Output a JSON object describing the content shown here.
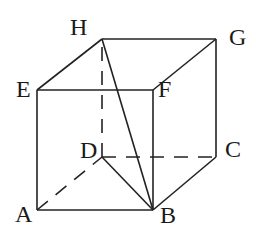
{
  "diagram": {
    "type": "cube",
    "vertices": {
      "A": {
        "label": "A",
        "x": 37,
        "y": 210
      },
      "B": {
        "label": "B",
        "x": 153,
        "y": 210
      },
      "C": {
        "label": "C",
        "x": 216,
        "y": 157
      },
      "D": {
        "label": "D",
        "x": 102,
        "y": 157
      },
      "E": {
        "label": "E",
        "x": 37,
        "y": 90
      },
      "F": {
        "label": "F",
        "x": 153,
        "y": 90
      },
      "G": {
        "label": "G",
        "x": 216,
        "y": 39
      },
      "H": {
        "label": "H",
        "x": 102,
        "y": 39
      }
    },
    "solid_edges": [
      "AB",
      "BC",
      "CG",
      "GH",
      "HE",
      "EA",
      "EF",
      "FB",
      "FG",
      "HB",
      "DB"
    ],
    "dashed_edges": [
      "AD",
      "DC",
      "DH"
    ]
  }
}
